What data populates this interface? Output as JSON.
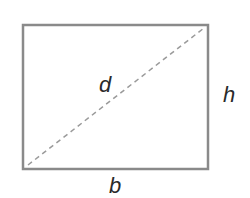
{
  "diagram": {
    "shape": "rectangle",
    "labels": {
      "diagonal": "d",
      "height": "h",
      "base": "b"
    },
    "colors": {
      "border": "#8a8a8a",
      "diagonal": "#9a9a9a",
      "text": "#2a2a2a",
      "background": "#ffffff"
    }
  }
}
